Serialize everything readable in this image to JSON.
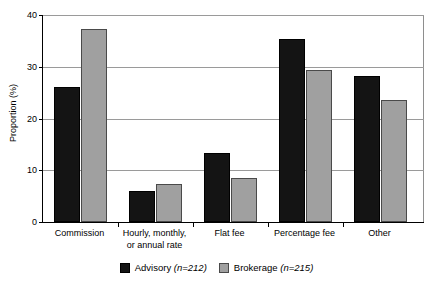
{
  "chart_data": {
    "type": "bar",
    "title": "",
    "xlabel": "",
    "ylabel": "Proportion (%)",
    "ylim": [
      0,
      40
    ],
    "yticks": [
      0,
      10,
      20,
      30,
      40
    ],
    "ytick_labels": [
      "0",
      "10",
      "20",
      "30",
      "40"
    ],
    "grid": true,
    "legend_position": "bottom-center",
    "categories": [
      "Commission",
      "Hourly, monthly,\nor annual rate",
      "Flat fee",
      "Percentage fee",
      "Other"
    ],
    "series": [
      {
        "name": "Advisory",
        "legend_label": "Advisory (n=212)",
        "n": 212,
        "color": "#141414",
        "values": [
          26.0,
          6.0,
          13.3,
          35.3,
          28.3
        ]
      },
      {
        "name": "Brokerage",
        "legend_label": "Brokerage (n=215)",
        "n": 215,
        "color": "#a0a0a0",
        "values": [
          37.3,
          7.4,
          8.5,
          29.4,
          23.5
        ]
      }
    ]
  },
  "axis": {
    "y_title": "Proportion (%)",
    "tick_0": "0",
    "tick_10": "10",
    "tick_20": "20",
    "tick_30": "30",
    "tick_40": "40"
  },
  "categories": {
    "c0": "Commission",
    "c1": "Hourly, monthly,\nor annual rate",
    "c2": "Flat fee",
    "c3": "Percentage fee",
    "c4": "Other"
  },
  "legend": {
    "advisory_name": "Advisory",
    "advisory_n": "(n=212)",
    "brokerage_name": "Brokerage",
    "brokerage_n": "(n=215)"
  }
}
